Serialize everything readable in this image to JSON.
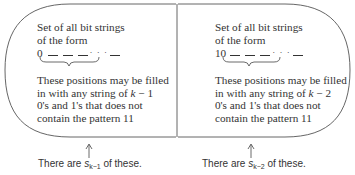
{
  "left_panel": {
    "title_line1": "Set of all bit strings",
    "title_line2": "of the form",
    "prefix": "0",
    "ellipsis": "· · ·",
    "desc_line1": "These positions may be filled",
    "desc_line2_pre": "in with any  string of ",
    "desc_line2_var": "k",
    "desc_line2_post": " − 1",
    "desc_line3": "0's and 1's that does not",
    "desc_line4": "contain the pattern 11",
    "caption_pre": "There are ",
    "caption_var": "s",
    "caption_sub": "k−1",
    "caption_post": " of these."
  },
  "right_panel": {
    "title_line1": "Set of all bit strings",
    "title_line2": "of the form",
    "prefix": "10",
    "ellipsis": "· · ·",
    "desc_line1": "These positions may be filled",
    "desc_line2_pre": "in with any  string of ",
    "desc_line2_var": "k",
    "desc_line2_post": " − 2",
    "desc_line3": "0's and 1's that does not",
    "desc_line4": "contain the pattern 11",
    "caption_pre": "There are ",
    "caption_var": "s",
    "caption_sub": "k−2",
    "caption_post": " of these."
  },
  "colors": {
    "outline": "#555555",
    "text": "#333333"
  }
}
